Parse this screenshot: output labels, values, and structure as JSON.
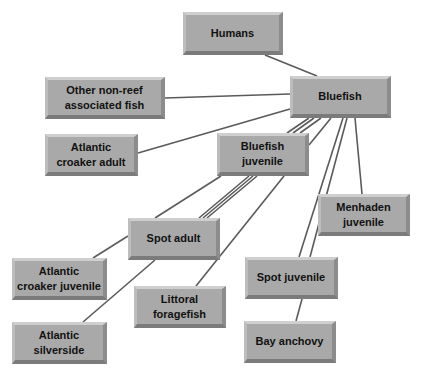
{
  "diagram": {
    "type": "food-web",
    "nodes": [
      {
        "id": "humans",
        "label": "Humans",
        "x": 183,
        "y": 12,
        "w": 100,
        "h": 43
      },
      {
        "id": "bluefish",
        "label": "Bluefish",
        "x": 290,
        "y": 76,
        "w": 101,
        "h": 42
      },
      {
        "id": "other-non-reef",
        "label": "Other non-reef\nassociated fish",
        "x": 45,
        "y": 77,
        "w": 120,
        "h": 42
      },
      {
        "id": "atlantic-croaker-adult",
        "label": "Atlantic\ncroaker adult",
        "x": 45,
        "y": 134,
        "w": 93,
        "h": 42
      },
      {
        "id": "bluefish-juvenile",
        "label": "Bluefish\njuvenile",
        "x": 217,
        "y": 133,
        "w": 92,
        "h": 43
      },
      {
        "id": "spot-adult",
        "label": "Spot adult",
        "x": 128,
        "y": 218,
        "w": 92,
        "h": 42
      },
      {
        "id": "menhaden-juvenile",
        "label": "Menhaden\njuvenile",
        "x": 318,
        "y": 194,
        "w": 92,
        "h": 42
      },
      {
        "id": "atlantic-croaker-juvenile",
        "label": "Atlantic\ncroaker juvenile",
        "x": 12,
        "y": 258,
        "w": 95,
        "h": 42
      },
      {
        "id": "littoral-foragefish",
        "label": "Littoral\nforagefish",
        "x": 134,
        "y": 286,
        "w": 92,
        "h": 42
      },
      {
        "id": "spot-juvenile",
        "label": "Spot juvenile",
        "x": 245,
        "y": 257,
        "w": 93,
        "h": 42
      },
      {
        "id": "atlantic-silverside",
        "label": "Atlantic\nsilverside",
        "x": 12,
        "y": 322,
        "w": 95,
        "h": 42
      },
      {
        "id": "bay-anchovy",
        "label": "Bay anchovy",
        "x": 244,
        "y": 321,
        "w": 92,
        "h": 42
      }
    ],
    "edges": [
      {
        "from": "humans",
        "to": "bluefish",
        "x1": 265,
        "y1": 55,
        "x2": 317,
        "y2": 76
      },
      {
        "from": "other-non-reef",
        "to": "bluefish",
        "x1": 165,
        "y1": 98,
        "x2": 290,
        "y2": 94
      },
      {
        "from": "atlantic-croaker-adult",
        "to": "bluefish",
        "x1": 138,
        "y1": 153,
        "x2": 290,
        "y2": 109
      },
      {
        "from": "bluefish",
        "to": "bluefish-juvenile",
        "x1": 309,
        "y1": 118,
        "x2": 287,
        "y2": 133
      },
      {
        "from": "bluefish",
        "to": "bluefish-juvenile",
        "x1": 314,
        "y1": 118,
        "x2": 293,
        "y2": 133
      },
      {
        "from": "bluefish",
        "to": "bluefish-juvenile",
        "x1": 321,
        "y1": 118,
        "x2": 300,
        "y2": 133
      },
      {
        "from": "bluefish",
        "to": "bluefish-juvenile",
        "x1": 331,
        "y1": 118,
        "x2": 309,
        "y2": 145
      },
      {
        "from": "bluefish-juvenile",
        "to": "atlantic-croaker-juvenile",
        "x1": 221,
        "y1": 176,
        "x2": 155,
        "y2": 218
      },
      {
        "from": "bluefish-juvenile",
        "to": "spot-adult",
        "x1": 249,
        "y1": 176,
        "x2": 199,
        "y2": 218
      },
      {
        "from": "bluefish-juvenile",
        "to": "spot-adult",
        "x1": 253,
        "y1": 176,
        "x2": 203,
        "y2": 218
      },
      {
        "from": "bluefish-juvenile",
        "to": "spot-adult",
        "x1": 257,
        "y1": 176,
        "x2": 207,
        "y2": 218
      },
      {
        "from": "bluefish-juvenile",
        "to": "littoral-foragefish",
        "x1": 284,
        "y1": 176,
        "x2": 196,
        "y2": 286
      },
      {
        "from": "bluefish",
        "to": "spot-juvenile",
        "x1": 343,
        "y1": 118,
        "x2": 299,
        "y2": 257
      },
      {
        "from": "bluefish",
        "to": "spot-juvenile",
        "x1": 347,
        "y1": 118,
        "x2": 310,
        "y2": 257
      },
      {
        "from": "bluefish",
        "to": "menhaden-juvenile",
        "x1": 355,
        "y1": 118,
        "x2": 362,
        "y2": 194
      },
      {
        "from": "spot-adult",
        "to": "atlantic-croaker-juvenile",
        "x1": 128,
        "y1": 236,
        "x2": 93,
        "y2": 258
      },
      {
        "from": "spot-adult",
        "to": "atlantic-silverside",
        "x1": 155,
        "y1": 260,
        "x2": 83,
        "y2": 322
      },
      {
        "from": "spot-juvenile",
        "to": "bay-anchovy",
        "x1": 302,
        "y1": 299,
        "x2": 296,
        "y2": 321
      }
    ],
    "colors": {
      "node_face": "#a9a9a9",
      "edge": "#5a5a5a",
      "text": "#111111",
      "background": "#ffffff"
    }
  }
}
